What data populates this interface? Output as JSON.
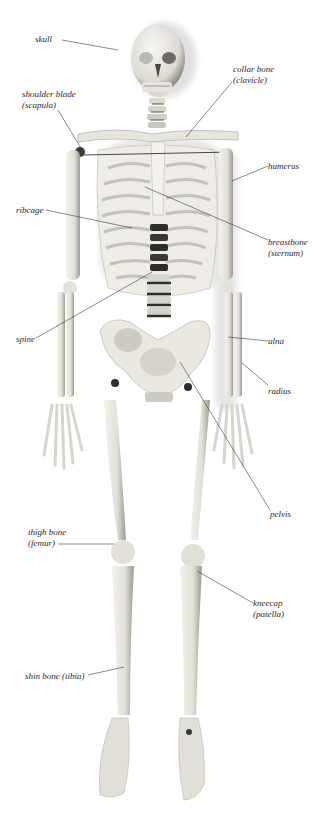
{
  "diagram": {
    "labels": [
      {
        "id": "skull",
        "text": "skull",
        "sub": "",
        "x": 35,
        "y": 34,
        "leader": [
          [
            62,
            40
          ],
          [
            118,
            50
          ]
        ]
      },
      {
        "id": "scapula",
        "text": "shoulder blade",
        "sub": "(scapula)",
        "x": 22,
        "y": 89,
        "leader": [
          [
            58,
            110
          ],
          [
            82,
            150
          ]
        ]
      },
      {
        "id": "clavicle",
        "text": "collar bone",
        "sub": "(clavicle)",
        "x": 233,
        "y": 64,
        "leader": [
          [
            232,
            82
          ],
          [
            186,
            137
          ]
        ]
      },
      {
        "id": "humerus",
        "text": "humerus",
        "sub": "",
        "x": 268,
        "y": 161,
        "leader": [
          [
            268,
            166
          ],
          [
            232,
            181
          ]
        ]
      },
      {
        "id": "ribcage",
        "text": "ribcage",
        "sub": "",
        "x": 16,
        "y": 205,
        "leader": [
          [
            46,
            210
          ],
          [
            132,
            228
          ]
        ]
      },
      {
        "id": "sternum",
        "text": "breastbone",
        "sub": "(sternum)",
        "x": 268,
        "y": 237,
        "leader": [
          [
            268,
            240
          ],
          [
            145,
            187
          ]
        ]
      },
      {
        "id": "spine",
        "text": "spine",
        "sub": "",
        "x": 16,
        "y": 334,
        "leader": [
          [
            36,
            338
          ],
          [
            152,
            272
          ]
        ]
      },
      {
        "id": "ulna",
        "text": "ulna",
        "sub": "",
        "x": 268,
        "y": 336,
        "leader": [
          [
            268,
            341
          ],
          [
            228,
            337
          ]
        ]
      },
      {
        "id": "radius",
        "text": "radius",
        "sub": "",
        "x": 268,
        "y": 386,
        "leader": [
          [
            268,
            385
          ],
          [
            242,
            363
          ]
        ]
      },
      {
        "id": "pelvis",
        "text": "pelvis",
        "sub": "",
        "x": 270,
        "y": 509,
        "leader": [
          [
            270,
            510
          ],
          [
            180,
            362
          ]
        ]
      },
      {
        "id": "femur",
        "text": "thigh bone",
        "sub": "(femur)",
        "x": 28,
        "y": 527,
        "leader": [
          [
            58,
            544
          ],
          [
            114,
            544
          ]
        ]
      },
      {
        "id": "patella",
        "text": "kneecap",
        "sub": "(patella)",
        "x": 253,
        "y": 598,
        "leader": [
          [
            253,
            603
          ],
          [
            197,
            571
          ]
        ]
      },
      {
        "id": "tibia",
        "text": "shin bone (tibia)",
        "sub": "",
        "x": 25,
        "y": 671,
        "leader": [
          [
            88,
            675
          ],
          [
            124,
            667
          ]
        ]
      }
    ]
  }
}
